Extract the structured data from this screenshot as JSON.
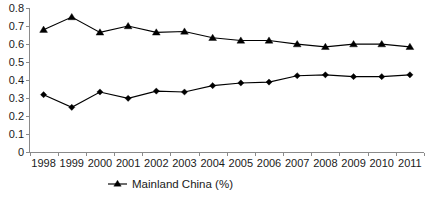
{
  "chart_data": {
    "type": "line",
    "title": "",
    "subtitle": "",
    "xlabel": "",
    "ylabel": "",
    "categories": [
      "1998",
      "1999",
      "2000",
      "2001",
      "2002",
      "2003",
      "2004",
      "2005",
      "2006",
      "2007",
      "2008",
      "2009",
      "2010",
      "2011"
    ],
    "ylim": [
      0,
      0.8
    ],
    "yticks": [
      "0",
      "0.1",
      "0.2",
      "0.3",
      "0.4",
      "0.5",
      "0.6",
      "0.7",
      "0.8"
    ],
    "ytick_values": [
      0,
      0.1,
      0.2,
      0.3,
      0.4,
      0.5,
      0.6,
      0.7,
      0.8
    ],
    "grid": false,
    "legend_position": "bottom-center",
    "series": [
      {
        "name": "upper-series",
        "marker": "triangle",
        "color": "#000000",
        "values": [
          0.68,
          0.75,
          0.665,
          0.7,
          0.665,
          0.67,
          0.635,
          0.62,
          0.62,
          0.6,
          0.585,
          0.6,
          0.6,
          0.585
        ]
      },
      {
        "name": "Mainland China (%)",
        "marker": "diamond",
        "color": "#000000",
        "values": [
          0.32,
          0.25,
          0.335,
          0.3,
          0.34,
          0.335,
          0.37,
          0.385,
          0.39,
          0.425,
          0.43,
          0.42,
          0.42,
          0.43
        ]
      }
    ],
    "legend": [
      {
        "label": "Mainland China (%)",
        "marker": "triangle",
        "color": "#000000"
      }
    ]
  },
  "axis": {
    "y_labels": [
      "0.8",
      "0.7",
      "0.6",
      "0.5",
      "0.4",
      "0.3",
      "0.2",
      "0.1",
      "0"
    ],
    "x_labels": [
      "1998",
      "1999",
      "2000",
      "2001",
      "2002",
      "2003",
      "2004",
      "2005",
      "2006",
      "2007",
      "2008",
      "2009",
      "2010",
      "2011"
    ]
  },
  "legend": {
    "series_label": "Mainland China (%)"
  },
  "colors": {
    "line": "#000000",
    "axis": "#8a8a8a",
    "text": "#1a1a1a",
    "background": "#ffffff"
  }
}
